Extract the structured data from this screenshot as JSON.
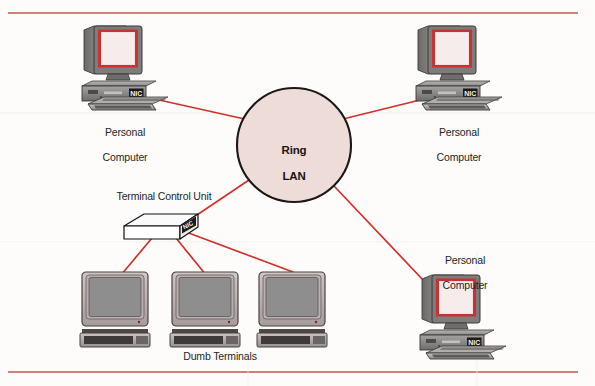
{
  "figure": {
    "type": "network-topology-diagram",
    "background_color": "#fdfcfb",
    "rule_color": "#c6544f",
    "link_color": "#d2302a",
    "ring_fill": "#eedcd8",
    "ring_stroke": "#1a1717",
    "case_body": "#8c8a8b",
    "screen_bezel": "#c83232",
    "screen_glass": "#f0dede",
    "terminal_glass": "#8e8e8e"
  },
  "nodes": {
    "ring": {
      "label_line1": "Ring",
      "label_line2": "LAN",
      "cx": 294,
      "cy": 145,
      "r": 57
    },
    "pc_top_left": {
      "label_line1": "Personal",
      "label_line2": "Computer",
      "nic": "NIC"
    },
    "pc_top_right": {
      "label_line1": "Personal",
      "label_line2": "Computer",
      "nic": "NIC"
    },
    "pc_bottom_right": {
      "label_line1": "Personal",
      "label_line2": "Computer",
      "nic": "NIC"
    },
    "terminal_control_unit": {
      "label": "Terminal Control Unit",
      "nic": "NIC"
    },
    "dumb_terminals": {
      "label": "Dumb Terminals",
      "count": 3
    }
  },
  "links": [
    {
      "from": "pc_top_left",
      "to": "ring"
    },
    {
      "from": "pc_top_right",
      "to": "ring"
    },
    {
      "from": "pc_bottom_right",
      "to": "ring"
    },
    {
      "from": "terminal_control_unit",
      "to": "ring"
    },
    {
      "from": "terminal_control_unit",
      "to": "dumb_terminal_1"
    },
    {
      "from": "terminal_control_unit",
      "to": "dumb_terminal_2"
    },
    {
      "from": "terminal_control_unit",
      "to": "dumb_terminal_3"
    }
  ],
  "rules": {
    "top_y": 13,
    "bottom_y": 372
  }
}
